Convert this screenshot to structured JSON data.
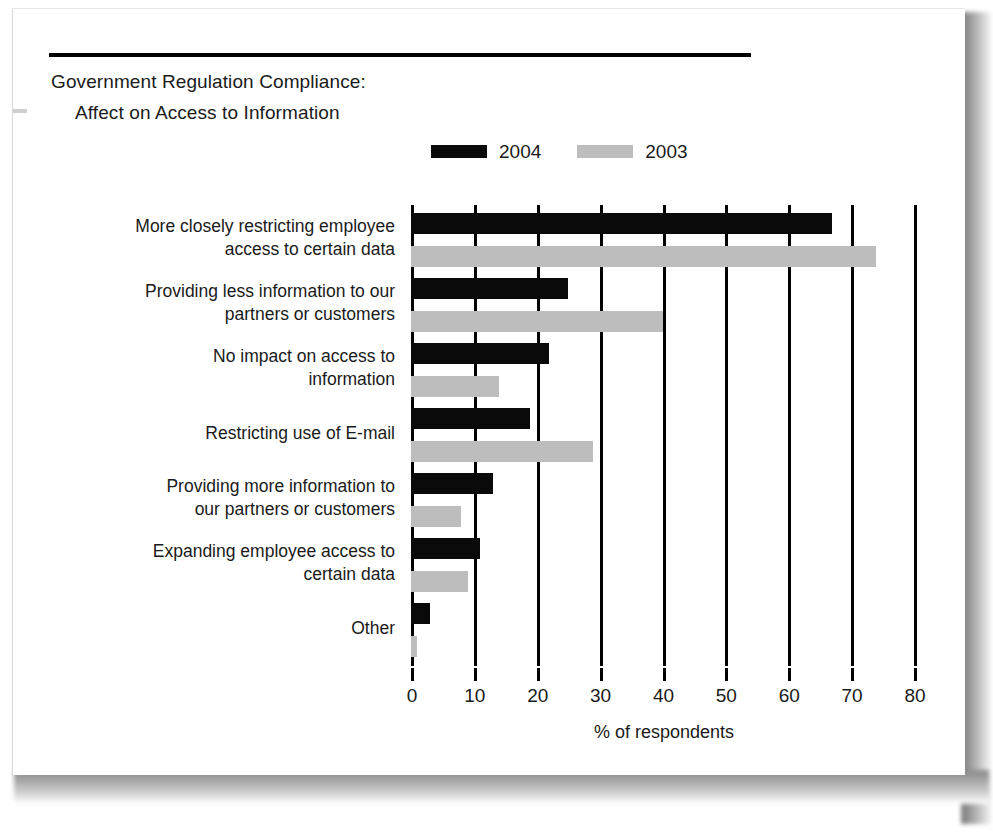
{
  "title": {
    "line1": "Government Regulation Compliance:",
    "line2": "Affect on Access to Information"
  },
  "legend": {
    "position": "top-center",
    "entries": [
      {
        "label": "2004",
        "color": "#0a0a0a",
        "swatch": "legend-swatch-2004"
      },
      {
        "label": "2003",
        "color": "#bdbdbd",
        "swatch": "legend-swatch-2003"
      }
    ]
  },
  "axis": {
    "x_title": "% of respondents",
    "ticks": [
      "0",
      "10",
      "20",
      "30",
      "40",
      "50",
      "60",
      "70",
      "80"
    ]
  },
  "chart_data": {
    "type": "bar",
    "orientation": "horizontal",
    "title": "Government Regulation Compliance: Affect on Access to Information",
    "xlabel": "% of respondents",
    "ylabel": "",
    "xlim": [
      0,
      80
    ],
    "xticks": [
      0,
      10,
      20,
      30,
      40,
      50,
      60,
      70,
      80
    ],
    "grid": true,
    "grid_axis": "x",
    "legend_position": "top-center",
    "categories": [
      "More closely restricting employee access to certain data",
      "Providing less information to our partners or customers",
      "No impact on access to information",
      "Restricting use of E-mail",
      "Providing more information to our partners or customers",
      "Expanding employee access to certain data",
      "Other"
    ],
    "category_lines": [
      [
        "More closely restricting employee",
        "access to certain data"
      ],
      [
        "Providing less information to our",
        "partners or customers"
      ],
      [
        "No impact on access to",
        "information"
      ],
      [
        "Restricting use of E-mail"
      ],
      [
        "Providing more information to",
        "our partners or customers"
      ],
      [
        "Expanding employee access to",
        "certain data"
      ],
      [
        "Other"
      ]
    ],
    "series": [
      {
        "name": "2004",
        "color": "#0a0a0a",
        "values": [
          67,
          25,
          22,
          19,
          13,
          11,
          3
        ]
      },
      {
        "name": "2003",
        "color": "#bdbdbd",
        "values": [
          74,
          40,
          14,
          29,
          8,
          9,
          1
        ]
      }
    ]
  }
}
